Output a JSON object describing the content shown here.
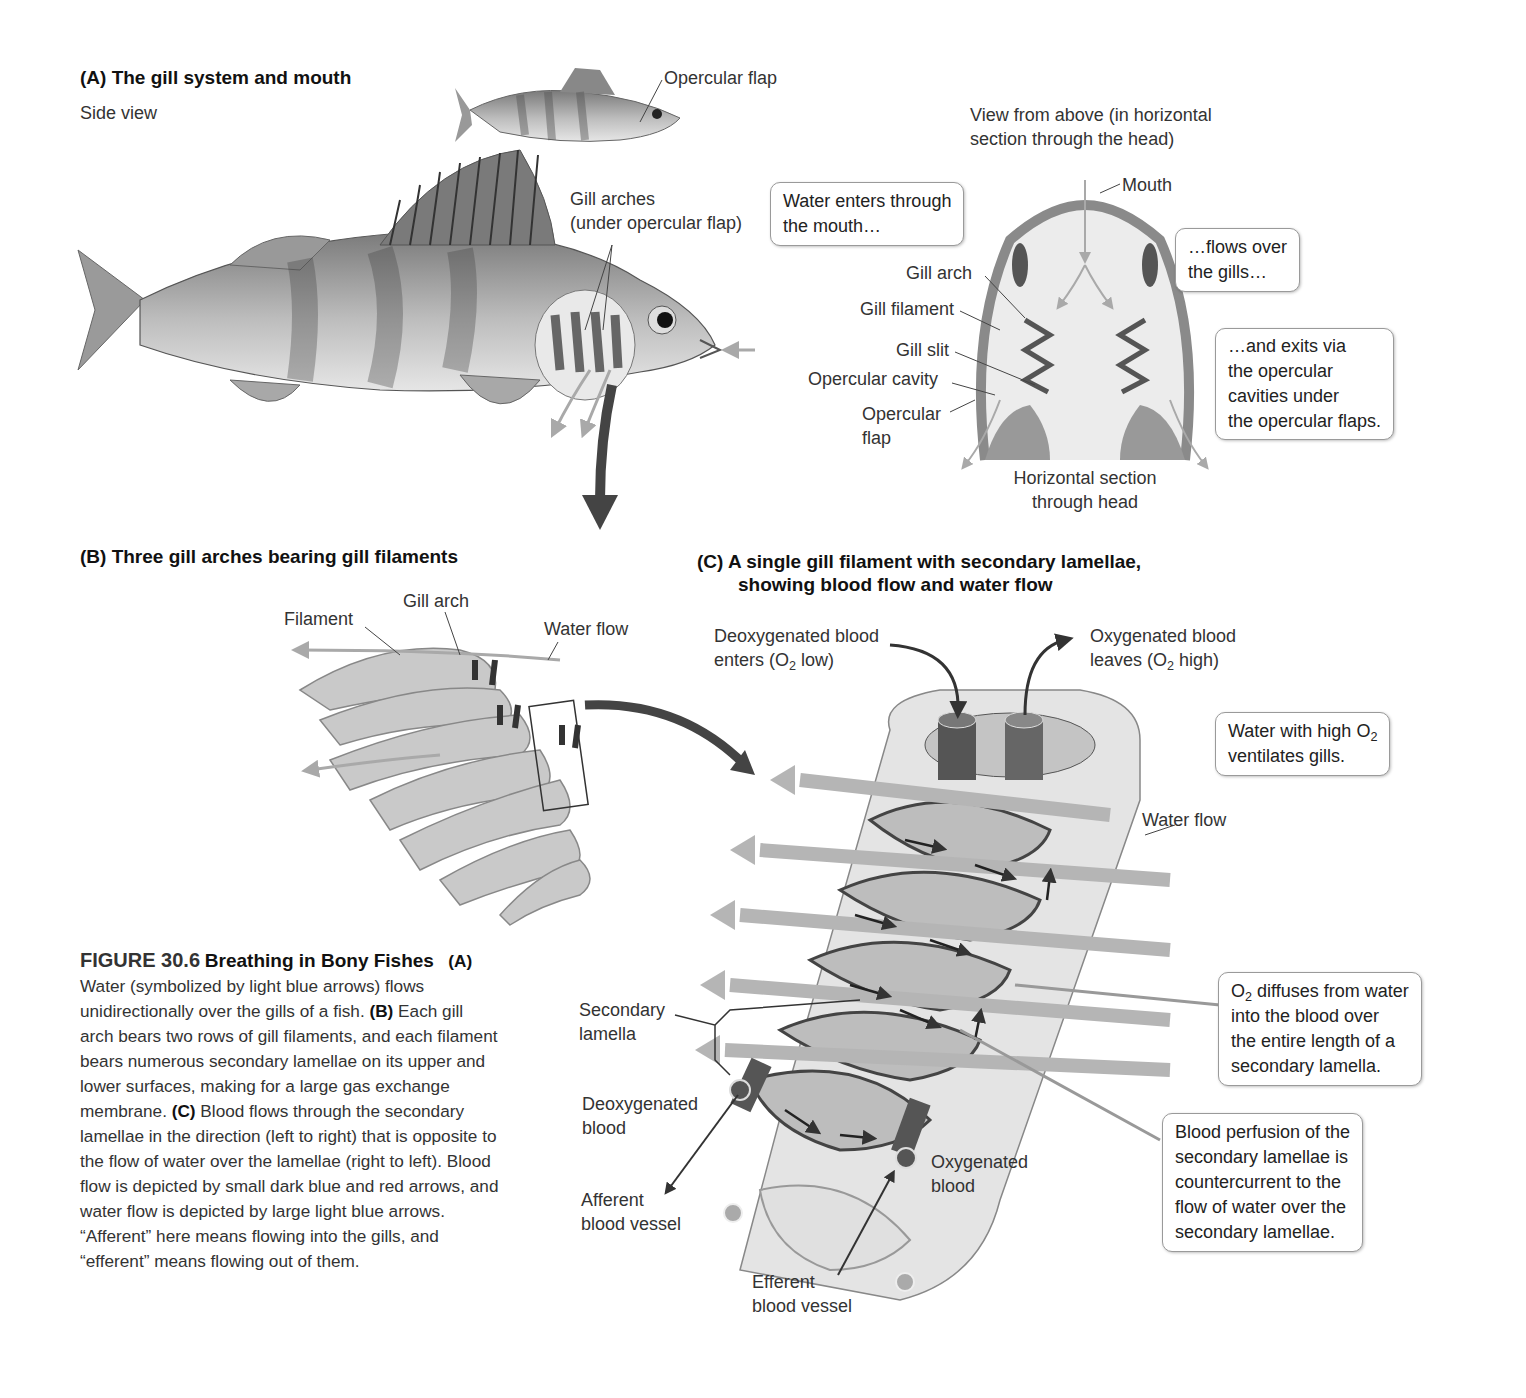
{
  "panel_a": {
    "title": "(A)  The gill system and mouth",
    "subtitle": "Side view",
    "labels": {
      "opercular_flap": "Opercular flap",
      "gill_arches_line1": "Gill arches",
      "gill_arches_line2": "(under opercular flap)"
    },
    "top_view": {
      "heading_line1": "View from above (in horizontal",
      "heading_line2": "section through the head)",
      "mouth": "Mouth",
      "gill_arch": "Gill arch",
      "gill_filament": "Gill filament",
      "gill_slit": "Gill slit",
      "opercular_cavity": "Opercular cavity",
      "opercular_flap_line1": "Opercular",
      "opercular_flap_line2": "flap",
      "section_line1": "Horizontal section",
      "section_line2": "through head"
    },
    "callouts": {
      "enters": [
        "Water enters through",
        "the mouth…"
      ],
      "flows": [
        "…flows over",
        "the gills…"
      ],
      "exits": [
        "…and exits via",
        "the opercular",
        "cavities under",
        "the opercular flaps."
      ]
    }
  },
  "panel_b": {
    "title": "(B)  Three gill arches bearing gill filaments",
    "labels": {
      "filament": "Filament",
      "gill_arch": "Gill arch",
      "water_flow": "Water flow"
    }
  },
  "panel_c": {
    "title_line1": "(C)  A single gill filament with secondary lamellae,",
    "title_line2": "showing blood flow and water flow",
    "labels": {
      "deoxy_enters_line1": "Deoxygenated blood",
      "deoxy_enters_line2_pre": "enters (O",
      "deoxy_enters_sub": "2",
      "deoxy_enters_line2_post": " low)",
      "oxy_leaves_line1": "Oxygenated blood",
      "oxy_leaves_line2_pre": "leaves (O",
      "oxy_leaves_sub": "2",
      "oxy_leaves_line2_post": " high)",
      "water_flow": "Water flow",
      "secondary_lamella_line1": "Secondary",
      "secondary_lamella_line2": "lamella",
      "deoxy_blood_line1": "Deoxygenated",
      "deoxy_blood_line2": "blood",
      "afferent_line1": "Afferent",
      "afferent_line2": "blood vessel",
      "efferent_line1": "Efferent",
      "efferent_line2": "blood vessel",
      "oxy_blood_line1": "Oxygenated",
      "oxy_blood_line2": "blood"
    },
    "callouts": {
      "high_o2_pre": "Water with high O",
      "high_o2_sub": "2",
      "high_o2_line2": "ventilates gills.",
      "diffuses_pre": "O",
      "diffuses_sub": "2",
      "diffuses_line1_post": " diffuses from water",
      "diffuses_line2": "into the blood over",
      "diffuses_line3": "the entire length of a",
      "diffuses_line4": "secondary lamella.",
      "perfusion": [
        "Blood perfusion of the",
        "secondary lamellae is",
        "countercurrent to the",
        "flow of water over the",
        "secondary lamellae."
      ]
    }
  },
  "caption": {
    "figure_number": "FIGURE 30.6",
    "figure_title": "Breathing in Bony Fishes",
    "a_tag": "(A)",
    "a_text": " Water (symbolized by light blue arrows) flows unidirectionally over the gills of a fish. ",
    "b_tag": "(B)",
    "b_text": " Each gill arch bears two rows of gill filaments, and each filament bears numerous secondary lamellae on its upper and lower surfaces, making for a large gas exchange membrane. ",
    "c_tag": "(C)",
    "c_text": " Blood flows through the secondary lamellae in the direction (left to right) that is opposite to the flow of water over the lamellae (right to left). Blood flow is depicted by small dark blue and red arrows, and water flow is depicted by large light blue arrows. “Afferent” here means flowing into the gills, and “efferent” means flowing out of them."
  },
  "colors": {
    "water_arrow": "#b5b5b5",
    "blood_dark": "#4a4a4a",
    "tissue": "#d4d4d4",
    "callout_border": "#9a9a9a"
  }
}
